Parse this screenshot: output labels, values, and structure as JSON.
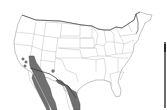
{
  "map": {
    "title": "",
    "region": "United States and northern Mexico",
    "colors": {
      "background": "#ffffff",
      "state_border": "#b8b8b8",
      "national_border": "#555555",
      "range_fill": "#6f6f6f",
      "range_stroke": "#4a4a4a",
      "record_dot": "#7a7a7a"
    },
    "range_areas": [
      {
        "id": "southern-california-baja",
        "description": "Shaded range from southern California/Arizona border south through Baja California"
      },
      {
        "id": "sonora-coast",
        "description": "Shaded range along Sonora coast, Mexico"
      },
      {
        "id": "texas-tamaulipas",
        "description": "Shaded range from southern Texas south into northeastern Mexico"
      }
    ],
    "isolated_records": [
      {
        "id": "dot-1",
        "x": 23,
        "y": 59
      },
      {
        "id": "dot-2",
        "x": 26,
        "y": 62
      },
      {
        "id": "dot-3",
        "x": 25,
        "y": 66
      },
      {
        "id": "dot-4",
        "x": 53,
        "y": 71
      }
    ]
  }
}
